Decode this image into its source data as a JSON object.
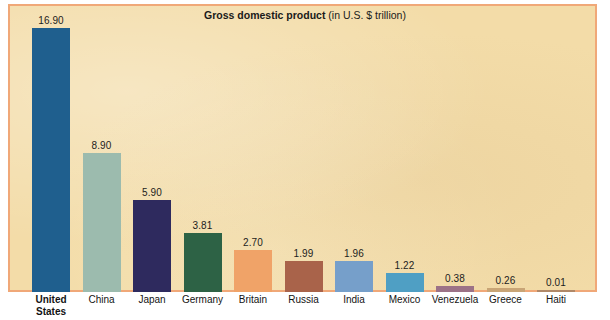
{
  "chart": {
    "title_main": "Gross domestic product",
    "title_sub": " (in U.S. $ trillion)",
    "background_color": "#f3dca8",
    "border_color": "#f0a878"
  },
  "chart_data": {
    "type": "bar",
    "title": "Gross domestic product (in U.S. $ trillion)",
    "xlabel": "",
    "ylabel": "",
    "ylim": [
      0,
      16.9
    ],
    "grid": false,
    "legend": "none",
    "categories": [
      "United States",
      "China",
      "Japan",
      "Germany",
      "Britain",
      "Russia",
      "India",
      "Mexico",
      "Venezuela",
      "Greece",
      "Haiti"
    ],
    "value_labels": [
      "16.90",
      "8.90",
      "5.90",
      "3.81",
      "2.70",
      "1.99",
      "1.96",
      "1.22",
      "0.38",
      "0.26",
      "0.01"
    ],
    "values": [
      16.9,
      8.9,
      5.9,
      3.81,
      2.7,
      1.99,
      1.96,
      1.22,
      0.38,
      0.26,
      0.01
    ],
    "colors": [
      "#1f5f8e",
      "#9cbbae",
      "#2e2a5e",
      "#2d6245",
      "#f0a368",
      "#a9634a",
      "#769fca",
      "#4f9fc4",
      "#9c7287",
      "#c9a576",
      "#b08868"
    ],
    "bold_categories": [
      "United States"
    ]
  }
}
